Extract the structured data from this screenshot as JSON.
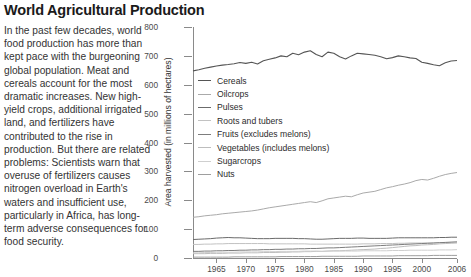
{
  "article": {
    "title": "World Agricultural Production",
    "body": "In the past few decades, world food production has more than kept pace with the burgeoning global population. Meat and cereals account for the most dramatic increases. New high-yield crops, additional irrigated land, and fertilizers have contributed to the rise in production. But there are related problems: Scientists warn that overuse of fertilizers causes nitrogen overload in Earth's waters and insufficient use, particularly in Africa, has long-term adverse consequences for food security."
  },
  "chart_data": {
    "type": "line",
    "title": "",
    "xlabel": "",
    "ylabel": "Area harvested (in millions of hectares)",
    "xlim": [
      1961,
      2006
    ],
    "ylim": [
      0,
      800
    ],
    "yticks": [
      0,
      100,
      200,
      300,
      400,
      500,
      600,
      700,
      800
    ],
    "xticks": [
      1965,
      1970,
      1975,
      1980,
      1985,
      1990,
      1995,
      2000,
      2006
    ],
    "grid": false,
    "legend_position": "inside-top-left",
    "x": [
      1961,
      1962,
      1963,
      1964,
      1965,
      1966,
      1967,
      1968,
      1969,
      1970,
      1971,
      1972,
      1973,
      1974,
      1975,
      1976,
      1977,
      1978,
      1979,
      1980,
      1981,
      1982,
      1983,
      1984,
      1985,
      1986,
      1987,
      1988,
      1989,
      1990,
      1991,
      1992,
      1993,
      1994,
      1995,
      1996,
      1997,
      1998,
      1999,
      2000,
      2001,
      2002,
      2003,
      2004,
      2005,
      2006
    ],
    "series": [
      {
        "name": "Cereals",
        "color": "#555555",
        "width": 1.1,
        "values": [
          648,
          652,
          657,
          661,
          665,
          668,
          670,
          673,
          677,
          674,
          678,
          672,
          683,
          688,
          693,
          700,
          697,
          709,
          704,
          713,
          718,
          705,
          697,
          713,
          709,
          697,
          689,
          700,
          709,
          707,
          705,
          702,
          697,
          690,
          694,
          700,
          697,
          693,
          691,
          678,
          674,
          669,
          666,
          676,
          682,
          684
        ]
      },
      {
        "name": "Oilcrops",
        "color": "#aaaaaa",
        "width": 1.0,
        "values": [
          141,
          143,
          146,
          148,
          150,
          153,
          155,
          157,
          159,
          161,
          163,
          166,
          170,
          174,
          177,
          180,
          183,
          186,
          189,
          192,
          195,
          192,
          198,
          205,
          208,
          211,
          214,
          212,
          219,
          225,
          228,
          231,
          237,
          243,
          247,
          252,
          256,
          261,
          268,
          272,
          270,
          276,
          283,
          289,
          293,
          296
        ]
      },
      {
        "name": "Pulses",
        "color": "#6b6b6b",
        "width": 1.0,
        "values": [
          64,
          65,
          66,
          67,
          69,
          70,
          71,
          70,
          70,
          69,
          68,
          67,
          67,
          67,
          68,
          68,
          68,
          68,
          67,
          67,
          66,
          65,
          65,
          66,
          67,
          68,
          68,
          68,
          69,
          69,
          68,
          68,
          68,
          68,
          69,
          70,
          70,
          70,
          70,
          70,
          70,
          70,
          71,
          71,
          72,
          72
        ]
      },
      {
        "name": "Roots and tubers",
        "color": "#c2c2c2",
        "width": 1.0,
        "values": [
          47,
          47,
          48,
          48,
          49,
          49,
          50,
          50,
          50,
          50,
          50,
          50,
          50,
          49,
          49,
          49,
          49,
          49,
          49,
          49,
          48,
          48,
          48,
          48,
          48,
          48,
          48,
          48,
          48,
          49,
          49,
          49,
          50,
          50,
          50,
          51,
          51,
          52,
          52,
          52,
          52,
          52,
          53,
          53,
          54,
          54
        ]
      },
      {
        "name": "Fruits (excludes melons)",
        "color": "#7d7d7d",
        "width": 1.0,
        "values": [
          23,
          23,
          24,
          24,
          25,
          25,
          26,
          26,
          27,
          27,
          28,
          28,
          29,
          29,
          30,
          30,
          31,
          31,
          32,
          32,
          33,
          33,
          34,
          35,
          35,
          36,
          37,
          38,
          39,
          40,
          41,
          42,
          43,
          44,
          45,
          46,
          47,
          48,
          49,
          50,
          51,
          52,
          53,
          54,
          55,
          56
        ]
      },
      {
        "name": "Vegetables (includes melons)",
        "color": "#bdbdbd",
        "width": 1.0,
        "values": [
          15,
          15,
          15,
          16,
          16,
          16,
          17,
          17,
          17,
          18,
          18,
          18,
          19,
          19,
          19,
          20,
          20,
          21,
          21,
          22,
          22,
          23,
          23,
          24,
          25,
          25,
          26,
          27,
          28,
          29,
          30,
          31,
          33,
          34,
          36,
          38,
          40,
          42,
          43,
          45,
          46,
          47,
          49,
          50,
          51,
          52
        ]
      },
      {
        "name": "Sugarcrops",
        "color": "#cfcfcf",
        "width": 1.0,
        "values": [
          18,
          18,
          19,
          19,
          20,
          20,
          20,
          20,
          21,
          21,
          21,
          21,
          22,
          22,
          22,
          23,
          23,
          23,
          23,
          24,
          24,
          24,
          23,
          24,
          24,
          24,
          24,
          24,
          24,
          25,
          25,
          25,
          25,
          25,
          26,
          26,
          26,
          27,
          27,
          27,
          27,
          27,
          28,
          28,
          28,
          29
        ]
      },
      {
        "name": "Nuts",
        "color": "#9e9e9e",
        "width": 1.0,
        "values": [
          3,
          3,
          3,
          3,
          3,
          3,
          3,
          4,
          4,
          4,
          4,
          4,
          4,
          4,
          4,
          5,
          5,
          5,
          5,
          5,
          5,
          5,
          6,
          6,
          6,
          6,
          6,
          6,
          6,
          7,
          7,
          7,
          7,
          7,
          7,
          8,
          8,
          8,
          8,
          8,
          8,
          9,
          9,
          9,
          9,
          9
        ]
      }
    ]
  }
}
